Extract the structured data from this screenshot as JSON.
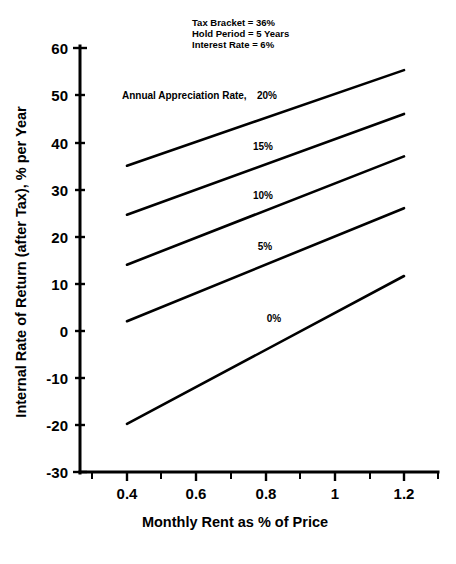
{
  "chart_data": {
    "type": "line",
    "title": "",
    "xlabel": "Monthly Rent as % of Price",
    "ylabel": "Internal Rate of Return (after Tax), % per Year",
    "xlim": [
      0.33,
      1.28
    ],
    "ylim": [
      -30,
      60
    ],
    "xticks": [
      "0.4",
      "0.6",
      "0.8",
      "1",
      "1.2"
    ],
    "xtick_values": [
      0.4,
      0.6,
      0.8,
      1.0,
      1.2
    ],
    "yticks": [
      "60",
      "50",
      "40",
      "30",
      "20",
      "10",
      "0",
      "-10",
      "-20",
      "-30"
    ],
    "ytick_values": [
      60,
      50,
      40,
      30,
      20,
      10,
      0,
      -10,
      -20,
      -30
    ],
    "grid": false,
    "legend_position": "inline-on-plot",
    "x": [
      0.4,
      1.2
    ],
    "series": [
      {
        "name": "20%",
        "label": "20%",
        "values": [
          35.0,
          55.3
        ]
      },
      {
        "name": "15%",
        "label": "15%",
        "values": [
          24.6,
          46.0
        ]
      },
      {
        "name": "10%",
        "label": "10%",
        "values": [
          14.0,
          37.0
        ]
      },
      {
        "name": "5%",
        "label": "5%",
        "values": [
          2.0,
          26.0
        ]
      },
      {
        "name": "0%",
        "label": "0%",
        "values": [
          -19.8,
          11.6
        ]
      }
    ],
    "series_label_positions": [
      {
        "name": "20%",
        "x": 1.03,
        "y": 49.5
      },
      {
        "name": "15%",
        "x": 0.93,
        "y": 39.0
      },
      {
        "name": "10%",
        "x": 0.93,
        "y": 28.5
      },
      {
        "name": "5%",
        "x": 0.93,
        "y": 18.0
      },
      {
        "name": "0%",
        "x": 0.96,
        "y": 2.0
      }
    ],
    "legend_lead_text": "Annual Appreciation Rate,",
    "annotations": [
      "Tax Bracket = 36%",
      "Hold Period = 5 Years",
      "Interest Rate = 6%"
    ]
  },
  "colors": {
    "background": "#ffffff",
    "axis": "#000000",
    "line": "#000000",
    "text": "#000000"
  }
}
